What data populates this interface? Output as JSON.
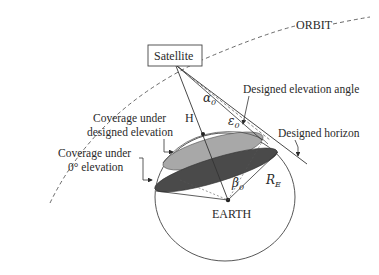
{
  "diagram": {
    "labels": {
      "orbit": "ORBIT",
      "satellite": "Satellite",
      "earth": "EARTH",
      "height": "H",
      "alpha": "α",
      "alpha_sub": "0",
      "epsilon": "ε",
      "epsilon_sub": "0",
      "beta": "β",
      "beta_sub": "0",
      "radius": "R",
      "radius_sub": "E",
      "designed_elevation_angle": "Designed elevation angle",
      "designed_horizon": "Designed horizon",
      "coverage_designed_line1": "Coverage under",
      "coverage_designed_line2": "designed elevation",
      "coverage_zero_line1": "Coverage under",
      "coverage_zero_line2": "0° elevation"
    },
    "colors": {
      "line": "#3a3a3a",
      "coverage_designed_fill": "#a8a8a8",
      "coverage_zero_fill": "#4a4a4a",
      "background": "#ffffff"
    }
  }
}
